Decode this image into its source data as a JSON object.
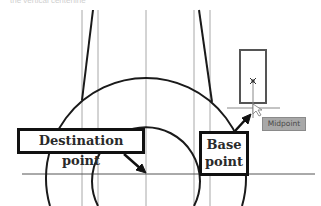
{
  "header": {
    "cropped_text": "the vertical centerline"
  },
  "callouts": {
    "destination_point": "Destination point",
    "base_point_line1": "Base",
    "base_point_line2": "point"
  },
  "osnap_tooltip": {
    "label": "Midpoint"
  },
  "colors": {
    "geometry": "#1a1a1a",
    "construction_lines": "#a0a0a0",
    "tooltip_bg": "#a8a8a8",
    "background": "#ffffff"
  }
}
